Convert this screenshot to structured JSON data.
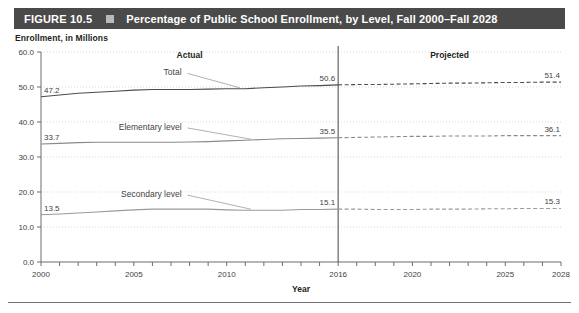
{
  "figure": {
    "label": "FIGURE 10.5",
    "marker_icon": "square-bullet-icon",
    "title": "Percentage of Public School Enrollment, by Level, Fall 2000–Fall 2028"
  },
  "axis_caption": "Enrollment, in Millions",
  "chart_data": {
    "type": "line",
    "title": "Percentage of Public School Enrollment, by Level, Fall 2000–Fall 2028",
    "xlabel": "Year",
    "ylabel": "Enrollment, in Millions",
    "ylim": [
      0.0,
      60.0
    ],
    "xlim": [
      2000,
      2028
    ],
    "ytick_labels": [
      "0.0",
      "10.0",
      "20.0",
      "30.0",
      "40.0",
      "50.0",
      "60.0"
    ],
    "ytick_values": [
      0.0,
      10.0,
      20.0,
      30.0,
      40.0,
      50.0,
      60.0
    ],
    "xtick_labels": [
      "2000",
      "2005",
      "2010",
      "2016",
      "2020",
      "2025",
      "2028"
    ],
    "xtick_values": [
      2000,
      2005,
      2010,
      2016,
      2020,
      2025,
      2028
    ],
    "grid": "horizontal-dotted",
    "legend": "inline-series-labels",
    "divider_year": 2016,
    "period_labels": [
      {
        "name": "actual",
        "text": "Actual",
        "x_year": 2008
      },
      {
        "name": "projected",
        "text": "Projected",
        "x_year": 2022
      }
    ],
    "series": [
      {
        "name": "Total",
        "label": "Total",
        "color": "#4d4d4d",
        "x": [
          2000,
          2001,
          2002,
          2003,
          2004,
          2005,
          2006,
          2007,
          2008,
          2009,
          2010,
          2011,
          2012,
          2013,
          2014,
          2015,
          2016,
          2017,
          2018,
          2019,
          2020,
          2021,
          2022,
          2023,
          2024,
          2025,
          2026,
          2027,
          2028
        ],
        "values": [
          47.2,
          47.7,
          48.2,
          48.5,
          48.8,
          49.1,
          49.3,
          49.3,
          49.3,
          49.4,
          49.5,
          49.5,
          49.8,
          50.0,
          50.3,
          50.4,
          50.6,
          50.7,
          50.7,
          50.8,
          50.9,
          51.0,
          51.1,
          51.1,
          51.2,
          51.3,
          51.3,
          51.4,
          51.4
        ],
        "labeled_points": [
          {
            "x_year": 2000,
            "value": "47.2"
          },
          {
            "x_year": 2016,
            "value": "50.6"
          },
          {
            "x_year": 2028,
            "value": "51.4"
          }
        ]
      },
      {
        "name": "Elementary level",
        "label": "Elementary level",
        "color": "#8a8a8a",
        "x": [
          2000,
          2001,
          2002,
          2003,
          2004,
          2005,
          2006,
          2007,
          2008,
          2009,
          2010,
          2011,
          2012,
          2013,
          2014,
          2015,
          2016,
          2017,
          2018,
          2019,
          2020,
          2021,
          2022,
          2023,
          2024,
          2025,
          2026,
          2027,
          2028
        ],
        "values": [
          33.7,
          33.9,
          34.1,
          34.2,
          34.2,
          34.2,
          34.2,
          34.2,
          34.3,
          34.4,
          34.6,
          34.8,
          35.0,
          35.2,
          35.3,
          35.4,
          35.5,
          35.6,
          35.7,
          35.8,
          35.9,
          35.9,
          36.0,
          36.0,
          36.0,
          36.1,
          36.1,
          36.1,
          36.1
        ],
        "labeled_points": [
          {
            "x_year": 2000,
            "value": "33.7"
          },
          {
            "x_year": 2016,
            "value": "35.5"
          },
          {
            "x_year": 2028,
            "value": "36.1"
          }
        ]
      },
      {
        "name": "Secondary level",
        "label": "Secondary level",
        "color": "#9a9a9a",
        "x": [
          2000,
          2001,
          2002,
          2003,
          2004,
          2005,
          2006,
          2007,
          2008,
          2009,
          2010,
          2011,
          2012,
          2013,
          2014,
          2015,
          2016,
          2017,
          2018,
          2019,
          2020,
          2021,
          2022,
          2023,
          2024,
          2025,
          2026,
          2027,
          2028
        ],
        "values": [
          13.5,
          13.7,
          14.0,
          14.3,
          14.6,
          14.9,
          15.1,
          15.1,
          15.1,
          15.1,
          14.9,
          14.8,
          14.8,
          14.8,
          15.0,
          15.0,
          15.1,
          15.1,
          15.0,
          15.0,
          15.0,
          15.1,
          15.1,
          15.1,
          15.2,
          15.2,
          15.3,
          15.3,
          15.3
        ],
        "labeled_points": [
          {
            "x_year": 2000,
            "value": "13.5"
          },
          {
            "x_year": 2016,
            "value": "15.1"
          },
          {
            "x_year": 2028,
            "value": "15.3"
          }
        ]
      }
    ]
  }
}
